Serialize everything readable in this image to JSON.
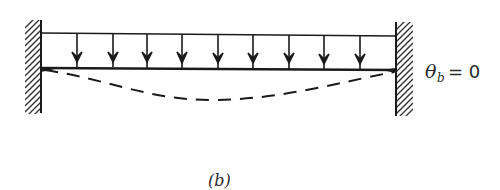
{
  "diagram": {
    "type": "fixed-fixed beam under uniform distributed load",
    "boundary_condition_label": {
      "symbol": "θ",
      "subscript": "b",
      "equals": "= 0"
    },
    "caption": "(b)",
    "load_arrow_count": 9,
    "colors": {
      "line": "#1a1a1a",
      "background": "#ffffff"
    }
  }
}
